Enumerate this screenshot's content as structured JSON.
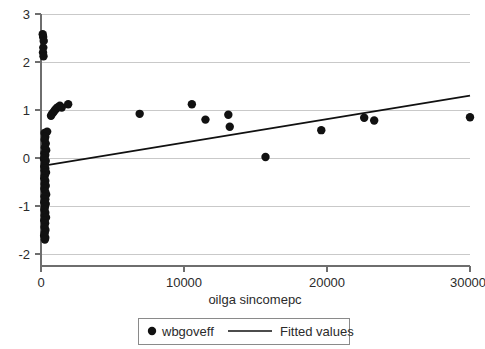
{
  "chart_data": {
    "type": "scatter",
    "title": "",
    "xlabel": "oilga sincomepc",
    "ylabel": "",
    "xlim": [
      -1200,
      31500
    ],
    "ylim": [
      -2.25,
      3.1
    ],
    "xticks": [
      0,
      10000,
      20000,
      30000
    ],
    "xticklabels": [
      "0",
      "10000",
      "20000",
      "30000"
    ],
    "yticks": [
      -2,
      -1,
      0,
      1,
      2,
      3
    ],
    "yticklabels": [
      "-2",
      "-1",
      "0",
      "1",
      "2",
      "3"
    ],
    "grid": "horizontal",
    "legend_position": "below-axes",
    "series": [
      {
        "name": "wbgoveff",
        "marker": "circle",
        "color": "#111111",
        "points": [
          [
            120,
            2.58
          ],
          [
            150,
            2.52
          ],
          [
            190,
            2.44
          ],
          [
            160,
            2.3
          ],
          [
            140,
            2.2
          ],
          [
            175,
            2.12
          ],
          [
            700,
            0.88
          ],
          [
            780,
            0.92
          ],
          [
            880,
            0.96
          ],
          [
            980,
            1.0
          ],
          [
            1080,
            1.03
          ],
          [
            1180,
            1.06
          ],
          [
            1320,
            1.09
          ],
          [
            1450,
            1.05
          ],
          [
            1900,
            1.12
          ],
          [
            250,
            0.52
          ],
          [
            430,
            0.55
          ],
          [
            300,
            0.44
          ],
          [
            260,
            0.38
          ],
          [
            330,
            0.3
          ],
          [
            270,
            0.22
          ],
          [
            360,
            0.16
          ],
          [
            240,
            0.1
          ],
          [
            300,
            0.06
          ],
          [
            250,
            0.02
          ],
          [
            210,
            -0.02
          ],
          [
            330,
            -0.06
          ],
          [
            270,
            -0.12
          ],
          [
            230,
            -0.18
          ],
          [
            300,
            -0.22
          ],
          [
            250,
            -0.26
          ],
          [
            350,
            -0.3
          ],
          [
            270,
            -0.36
          ],
          [
            230,
            -0.42
          ],
          [
            300,
            -0.48
          ],
          [
            260,
            -0.54
          ],
          [
            330,
            -0.58
          ],
          [
            240,
            -0.64
          ],
          [
            290,
            -0.7
          ],
          [
            360,
            -0.76
          ],
          [
            250,
            -0.8
          ],
          [
            300,
            -0.86
          ],
          [
            230,
            -0.92
          ],
          [
            330,
            -0.96
          ],
          [
            270,
            -1.02
          ],
          [
            240,
            -1.08
          ],
          [
            300,
            -1.14
          ],
          [
            260,
            -1.2
          ],
          [
            350,
            -1.24
          ],
          [
            230,
            -1.3
          ],
          [
            290,
            -1.36
          ],
          [
            250,
            -1.44
          ],
          [
            310,
            -1.5
          ],
          [
            260,
            -1.56
          ],
          [
            220,
            -1.62
          ],
          [
            300,
            -1.66
          ],
          [
            270,
            -1.7
          ],
          [
            6900,
            0.92
          ],
          [
            10550,
            1.12
          ],
          [
            11500,
            0.8
          ],
          [
            13100,
            0.9
          ],
          [
            13200,
            0.65
          ],
          [
            15700,
            0.02
          ],
          [
            19600,
            0.58
          ],
          [
            22600,
            0.84
          ],
          [
            23300,
            0.78
          ],
          [
            30000,
            0.85
          ]
        ]
      }
    ],
    "fit": {
      "name": "Fitted values",
      "color": "#111111",
      "x0": 0,
      "y0": -0.17,
      "x1": 30000,
      "y1": 1.3
    },
    "legend": [
      {
        "label": "wbgoveff",
        "type": "marker"
      },
      {
        "label": "Fitted values",
        "type": "line"
      }
    ]
  },
  "axes": {
    "x_title": "oilga sincomepc",
    "x_tick_0": "0",
    "x_tick_1": "10000",
    "x_tick_2": "20000",
    "x_tick_3": "30000",
    "y_tick_0": "3",
    "y_tick_1": "2",
    "y_tick_2": "1",
    "y_tick_3": "0",
    "y_tick_4": "-1",
    "y_tick_5": "-2"
  },
  "legend": {
    "marker_label": "wbgoveff",
    "line_label": "Fitted values"
  },
  "colors": {
    "marker": "#111111",
    "fit_line": "#111111",
    "grid": "#c9c9c9",
    "axis": "#6e6e6e",
    "text": "#2b2b2b",
    "background": "#ffffff"
  }
}
